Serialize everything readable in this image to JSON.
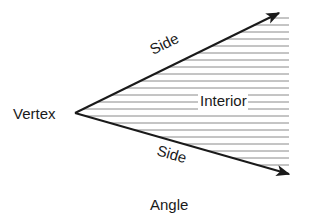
{
  "diagram": {
    "title": "Angle",
    "labels": {
      "vertex": "Vertex",
      "side_upper": "Side",
      "side_lower": "Side",
      "interior": "Interior"
    },
    "colors": {
      "line": "#1a1a1a",
      "hatch": "#8a8a8a",
      "background": "#ffffff"
    }
  }
}
